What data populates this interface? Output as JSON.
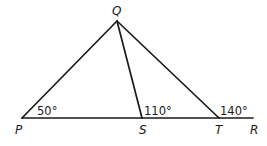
{
  "diagram": {
    "points": {
      "P": {
        "label": "P",
        "x": 22,
        "y": 118
      },
      "Q": {
        "label": "Q",
        "x": 117,
        "y": 21
      },
      "S": {
        "label": "S",
        "x": 142,
        "y": 118
      },
      "T": {
        "label": "T",
        "x": 219,
        "y": 118
      },
      "R": {
        "label": "R",
        "x": 253,
        "y": 118
      }
    },
    "segments": [
      "PQ",
      "QS",
      "QT",
      "PR"
    ],
    "angles": {
      "P": "50°",
      "S": "110°",
      "T": "140°"
    },
    "colors": {
      "line": "#1a1a1a",
      "background": "#ffffff"
    }
  }
}
